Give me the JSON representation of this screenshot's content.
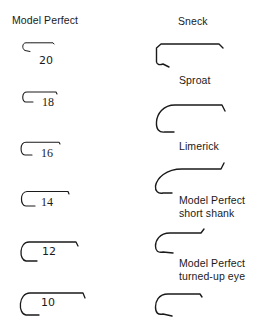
{
  "left_column": {
    "title": "Model Perfect",
    "sizes": [
      {
        "label": "20"
      },
      {
        "label": "18"
      },
      {
        "label": "16"
      },
      {
        "label": "14"
      },
      {
        "label": "12"
      },
      {
        "label": "10"
      }
    ]
  },
  "right_column": {
    "hooks": [
      {
        "label": "Sneck"
      },
      {
        "label": "Sproat"
      },
      {
        "label": "Limerick"
      },
      {
        "label_line1": "Model Perfect",
        "label_line2": "short shank"
      },
      {
        "label_line1": "Model Perfect",
        "label_line2": "turned-up eye"
      }
    ]
  }
}
